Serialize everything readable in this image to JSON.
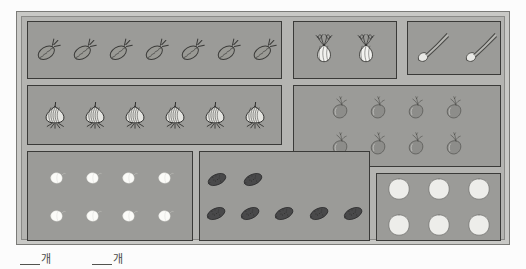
{
  "worksheet": {
    "title": "vegetable-crate-counting-worksheet",
    "frame_color": "#c9c9c6",
    "cell_color": "#9b9b98",
    "border_color": "#3a3a38"
  },
  "compartments": [
    {
      "id": "carrots",
      "item_name": "carrot-icon",
      "count": 7,
      "rows": [
        7
      ],
      "color": "#9a9a95",
      "outline": "#3b3b39"
    },
    {
      "id": "fennel",
      "item_name": "fennel-bulb-icon",
      "count": 2,
      "rows": [
        2
      ],
      "color": "#f2f2ef",
      "outline": "#2e2e2c"
    },
    {
      "id": "scallions",
      "item_name": "scallion-icon",
      "count": 2,
      "rows": [
        2
      ],
      "color": "#e8e8e5",
      "outline": "#4a4a47"
    },
    {
      "id": "onions",
      "item_name": "onion-icon",
      "count": 6,
      "rows": [
        6
      ],
      "color": "#e4e4e0",
      "outline": "#242422"
    },
    {
      "id": "eggplants",
      "item_name": "eggplant-icon",
      "count": 8,
      "rows": [
        4,
        4
      ],
      "color": "#8d8d8a",
      "outline": "#4f4f4c"
    },
    {
      "id": "garlic",
      "item_name": "garlic-clove-icon",
      "count": 8,
      "rows": [
        4,
        4
      ],
      "color": "#fbfbf8",
      "outline": "#d6d6d2"
    },
    {
      "id": "cucumbers",
      "item_name": "cucumber-icon",
      "count": 7,
      "rows": [
        2,
        5
      ],
      "color": "#49494a",
      "outline": "#1d1d1e"
    },
    {
      "id": "potatoes",
      "item_name": "potato-icon",
      "count": 6,
      "rows": [
        3,
        3
      ],
      "color": "#ededea",
      "outline": "#6f6f6c"
    }
  ],
  "captions": [
    {
      "id": "answer-blank-1",
      "blank": "",
      "unit": "개"
    },
    {
      "id": "answer-blank-2",
      "blank": "",
      "unit": "개"
    }
  ]
}
